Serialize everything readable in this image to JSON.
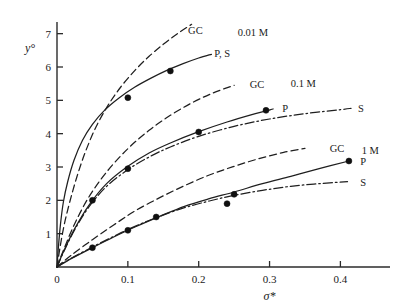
{
  "chart_data": {
    "type": "line",
    "title": "",
    "xlabel": "σ*",
    "ylabel": "y°",
    "xlim": [
      0,
      0.47
    ],
    "ylim": [
      0,
      7.35
    ],
    "grid": false,
    "legend_position": "inline-right-of-curve",
    "x_ticks": [
      "0",
      "0.1",
      "0.2",
      "0.3",
      "0.4"
    ],
    "x_tick_values": [
      0,
      0.1,
      0.2,
      0.3,
      0.4
    ],
    "y_ticks": [
      "0",
      "1",
      "2",
      "3",
      "4",
      "5",
      "6",
      "7"
    ],
    "y_tick_values": [
      0,
      1,
      2,
      3,
      4,
      5,
      6,
      7
    ],
    "groups": [
      {
        "concentration_label": "0.01 M",
        "concentration_x": 0.255,
        "concentration_y": 7.05,
        "series": [
          {
            "name": "GC",
            "style": "dashed",
            "label": "GC",
            "label_x": 0.185,
            "label_y": 7.1,
            "x": [
              0.0,
              0.004,
              0.01,
              0.018,
              0.028,
              0.04,
              0.055,
              0.072,
              0.09,
              0.11,
              0.13,
              0.15,
              0.17,
              0.19
            ],
            "y": [
              0.0,
              0.55,
              1.25,
              1.95,
              2.7,
              3.45,
              4.2,
              4.85,
              5.4,
              5.9,
              6.32,
              6.68,
              7.0,
              7.28
            ]
          },
          {
            "name": "P, S",
            "style": "solid",
            "label": "P, S",
            "label_x": 0.222,
            "label_y": 6.42,
            "x": [
              0.0,
              0.002,
              0.005,
              0.009,
              0.015,
              0.024,
              0.036,
              0.05,
              0.068,
              0.088,
              0.11,
              0.132,
              0.155,
              0.178,
              0.2,
              0.218
            ],
            "y": [
              0.0,
              0.6,
              1.3,
              1.95,
              2.55,
              3.2,
              3.8,
              4.28,
              4.72,
              5.08,
              5.4,
              5.66,
              5.9,
              6.1,
              6.27,
              6.38
            ],
            "points_x": [
              0.05,
              0.1,
              0.16
            ],
            "points_y": [
              2.0,
              5.08,
              5.88
            ]
          }
        ],
        "marker_series": "P, S",
        "markers": [
          {
            "x": 0.05,
            "y": 2.0
          },
          {
            "x": 0.1,
            "y": 5.08
          },
          {
            "x": 0.16,
            "y": 5.88
          }
        ]
      },
      {
        "concentration_label": "0.1 M",
        "concentration_x": 0.33,
        "concentration_y": 5.52,
        "series": [
          {
            "name": "GC",
            "style": "dashed",
            "label": "GC",
            "label_x": 0.272,
            "label_y": 5.48,
            "x": [
              0.0,
              0.01,
              0.025,
              0.045,
              0.07,
              0.1,
              0.13,
              0.16,
              0.19,
              0.22,
              0.25
            ],
            "y": [
              0.0,
              0.55,
              1.3,
              2.1,
              2.85,
              3.55,
              4.1,
              4.55,
              4.92,
              5.22,
              5.45
            ]
          },
          {
            "name": "P",
            "style": "solid",
            "label": "P",
            "label_x": 0.318,
            "label_y": 4.78,
            "x": [
              0.0,
              0.01,
              0.025,
              0.045,
              0.07,
              0.1,
              0.13,
              0.16,
              0.2,
              0.24,
              0.28,
              0.305
            ],
            "y": [
              0.0,
              0.5,
              1.15,
              1.85,
              2.5,
              3.02,
              3.42,
              3.72,
              4.06,
              4.35,
              4.6,
              4.74
            ]
          },
          {
            "name": "S",
            "style": "dash-dot",
            "label": "S",
            "label_x": 0.425,
            "label_y": 4.78,
            "x": [
              0.0,
              0.01,
              0.025,
              0.045,
              0.07,
              0.1,
              0.13,
              0.16,
              0.2,
              0.25,
              0.3,
              0.35,
              0.4,
              0.415
            ],
            "y": [
              0.0,
              0.48,
              1.12,
              1.8,
              2.42,
              2.92,
              3.3,
              3.6,
              3.92,
              4.22,
              4.44,
              4.6,
              4.72,
              4.76
            ]
          }
        ],
        "marker_series": "P",
        "markers": [
          {
            "x": 0.1,
            "y": 2.95
          },
          {
            "x": 0.2,
            "y": 4.05
          },
          {
            "x": 0.295,
            "y": 4.7
          }
        ]
      },
      {
        "concentration_label": "1 M",
        "concentration_x": 0.43,
        "concentration_y": 3.52,
        "series": [
          {
            "name": "GC",
            "style": "dashed",
            "label": "GC",
            "label_x": 0.385,
            "label_y": 3.58,
            "x": [
              0.0,
              0.02,
              0.05,
              0.08,
              0.11,
              0.145,
              0.18,
              0.215,
              0.25,
              0.285,
              0.32,
              0.35
            ],
            "y": [
              0.0,
              0.35,
              0.82,
              1.26,
              1.68,
              2.08,
              2.44,
              2.76,
              3.02,
              3.25,
              3.44,
              3.56
            ]
          },
          {
            "name": "P",
            "style": "solid",
            "label": "P",
            "label_x": 0.428,
            "label_y": 3.18,
            "x": [
              0.0,
              0.02,
              0.05,
              0.08,
              0.11,
              0.145,
              0.18,
              0.215,
              0.25,
              0.29,
              0.33,
              0.37,
              0.412
            ],
            "y": [
              0.0,
              0.25,
              0.58,
              0.9,
              1.2,
              1.52,
              1.82,
              2.05,
              2.25,
              2.5,
              2.72,
              2.95,
              3.18
            ]
          },
          {
            "name": "S",
            "style": "dash-dot",
            "label": "S",
            "label_x": 0.428,
            "label_y": 2.56,
            "x": [
              0.0,
              0.02,
              0.05,
              0.08,
              0.11,
              0.145,
              0.18,
              0.215,
              0.25,
              0.29,
              0.33,
              0.37,
              0.41
            ],
            "y": [
              0.0,
              0.26,
              0.6,
              0.92,
              1.22,
              1.52,
              1.78,
              1.98,
              2.15,
              2.3,
              2.42,
              2.5,
              2.56
            ]
          }
        ],
        "marker_series": "P",
        "markers": [
          {
            "x": 0.05,
            "y": 0.58
          },
          {
            "x": 0.1,
            "y": 1.1
          },
          {
            "x": 0.14,
            "y": 1.5
          },
          {
            "x": 0.24,
            "y": 1.9
          },
          {
            "x": 0.25,
            "y": 2.18
          },
          {
            "x": 0.412,
            "y": 3.18
          }
        ]
      }
    ]
  },
  "axes": {
    "x_title": "σ*",
    "y_title": "y°",
    "origin_label": "0"
  }
}
